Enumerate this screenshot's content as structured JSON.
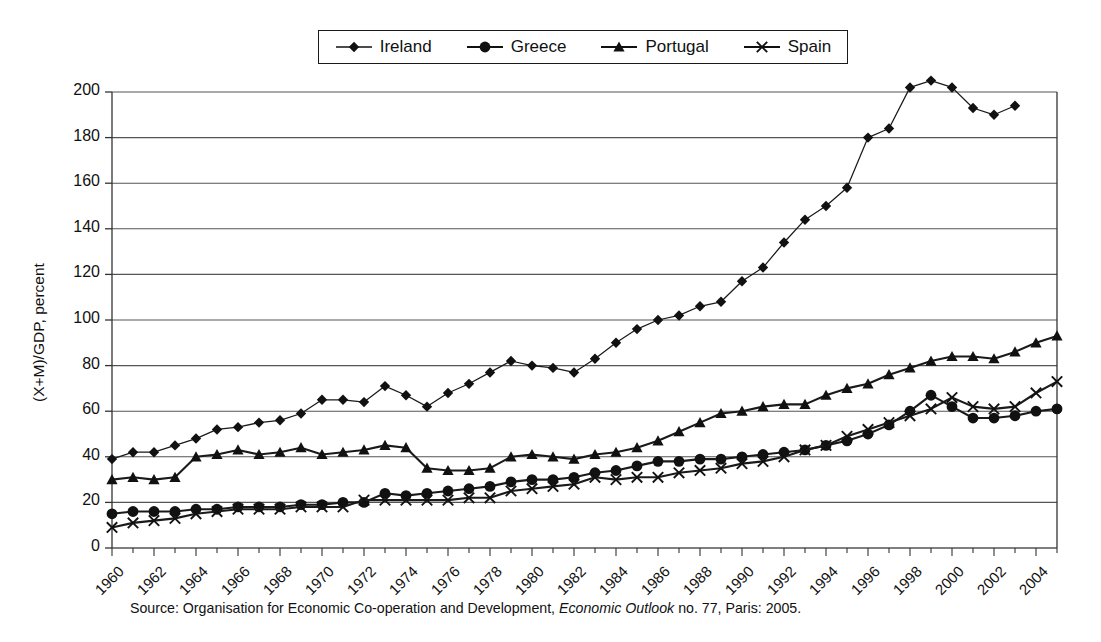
{
  "chart_data": {
    "type": "line",
    "title": "",
    "xlabel": "",
    "ylabel": "(X+M)/GDP, percent",
    "xlim": [
      1960,
      2005
    ],
    "ylim": [
      0,
      200
    ],
    "ytick_step": 20,
    "yticks": [
      0,
      20,
      40,
      60,
      80,
      100,
      120,
      140,
      160,
      180,
      200
    ],
    "xticks": [
      1960,
      1962,
      1964,
      1966,
      1968,
      1970,
      1972,
      1974,
      1976,
      1978,
      1980,
      1982,
      1984,
      1986,
      1988,
      1990,
      1992,
      1994,
      1996,
      1998,
      2000,
      2002,
      2004
    ],
    "grid": "horizontal",
    "legend_position": "top-center",
    "x": [
      1960,
      1961,
      1962,
      1963,
      1964,
      1965,
      1966,
      1967,
      1968,
      1969,
      1970,
      1971,
      1972,
      1973,
      1974,
      1975,
      1976,
      1977,
      1978,
      1979,
      1980,
      1981,
      1982,
      1983,
      1984,
      1985,
      1986,
      1987,
      1988,
      1989,
      1990,
      1991,
      1992,
      1993,
      1994,
      1995,
      1996,
      1997,
      1998,
      1999,
      2000,
      2001,
      2002,
      2003,
      2004,
      2005
    ],
    "series": [
      {
        "name": "Ireland",
        "marker": "diamond",
        "color": "#1a1a1a",
        "values": [
          39,
          42,
          42,
          45,
          48,
          52,
          53,
          55,
          56,
          59,
          65,
          65,
          64,
          71,
          67,
          62,
          68,
          72,
          77,
          82,
          80,
          79,
          77,
          83,
          90,
          96,
          100,
          102,
          106,
          108,
          117,
          123,
          134,
          144,
          150,
          158,
          180,
          184,
          202,
          205,
          202,
          193,
          190,
          194,
          0,
          0
        ]
      },
      {
        "name": "Greece",
        "marker": "circle",
        "color": "#1a1a1a",
        "values": [
          15,
          16,
          16,
          16,
          17,
          17,
          18,
          18,
          18,
          19,
          19,
          20,
          20,
          24,
          23,
          24,
          25,
          26,
          27,
          29,
          30,
          30,
          31,
          33,
          34,
          36,
          38,
          38,
          39,
          39,
          40,
          41,
          42,
          43,
          45,
          47,
          50,
          54,
          60,
          67,
          62,
          57,
          57,
          58,
          60,
          61
        ]
      },
      {
        "name": "Portugal",
        "marker": "triangle",
        "color": "#1a1a1a",
        "values": [
          30,
          31,
          30,
          31,
          40,
          41,
          43,
          41,
          42,
          44,
          41,
          42,
          43,
          45,
          44,
          35,
          34,
          34,
          35,
          40,
          41,
          40,
          39,
          41,
          42,
          44,
          47,
          51,
          55,
          59,
          60,
          62,
          63,
          63,
          67,
          70,
          72,
          76,
          79,
          82,
          84,
          84,
          83,
          86,
          90,
          93
        ]
      },
      {
        "name": "Spain",
        "marker": "cross",
        "color": "#1a1a1a",
        "values": [
          9,
          11,
          12,
          13,
          15,
          16,
          17,
          17,
          17,
          18,
          18,
          18,
          21,
          21,
          21,
          21,
          21,
          22,
          22,
          25,
          26,
          27,
          28,
          31,
          30,
          31,
          31,
          33,
          34,
          35,
          37,
          38,
          40,
          43,
          45,
          49,
          52,
          55,
          58,
          61,
          66,
          62,
          61,
          62,
          68,
          73
        ]
      }
    ],
    "series_gaps": {
      "Ireland": {
        "last_year": 2003,
        "note_values_after": []
      }
    }
  },
  "legend": {
    "entries": [
      {
        "label": "Ireland",
        "marker": "diamond"
      },
      {
        "label": "Greece",
        "marker": "circle"
      },
      {
        "label": "Portugal",
        "marker": "triangle"
      },
      {
        "label": "Spain",
        "marker": "cross"
      }
    ]
  },
  "source": {
    "prefix": "Source: Organisation for Economic Co-operation and Development,",
    "italic": "Economic Outlook",
    "suffix": "no. 77, Paris: 2005."
  }
}
